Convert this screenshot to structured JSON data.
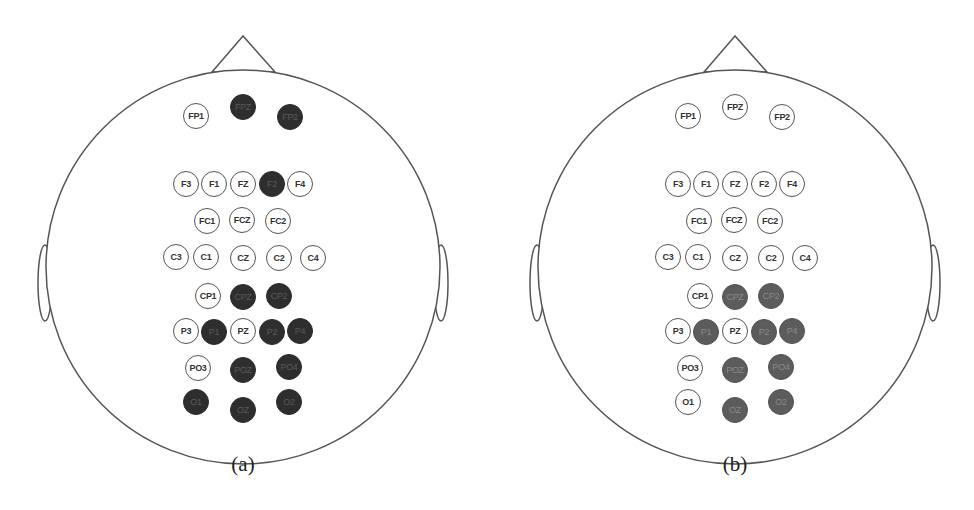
{
  "figure": {
    "panels": [
      {
        "id": "a",
        "caption": "(a)",
        "fill_color": "#2e2e2e",
        "electrodes": [
          {
            "label": "FP1",
            "x": 196,
            "y": 116,
            "selected": false
          },
          {
            "label": "FPZ",
            "x": 243,
            "y": 107,
            "selected": true
          },
          {
            "label": "FP2",
            "x": 290,
            "y": 117,
            "selected": true
          },
          {
            "label": "F3",
            "x": 186,
            "y": 184,
            "selected": false
          },
          {
            "label": "F1",
            "x": 214,
            "y": 184,
            "selected": false
          },
          {
            "label": "FZ",
            "x": 243,
            "y": 184,
            "selected": false
          },
          {
            "label": "F2",
            "x": 272,
            "y": 184,
            "selected": true
          },
          {
            "label": "F4",
            "x": 300,
            "y": 184,
            "selected": false
          },
          {
            "label": "FC1",
            "x": 207,
            "y": 221,
            "selected": false
          },
          {
            "label": "FCZ",
            "x": 242,
            "y": 220,
            "selected": false
          },
          {
            "label": "FC2",
            "x": 278,
            "y": 221,
            "selected": false
          },
          {
            "label": "C3",
            "x": 176,
            "y": 257,
            "selected": false
          },
          {
            "label": "C1",
            "x": 206,
            "y": 257,
            "selected": false
          },
          {
            "label": "CZ",
            "x": 243,
            "y": 258,
            "selected": false
          },
          {
            "label": "C2",
            "x": 279,
            "y": 258,
            "selected": false
          },
          {
            "label": "C4",
            "x": 313,
            "y": 258,
            "selected": false
          },
          {
            "label": "CP1",
            "x": 208,
            "y": 296,
            "selected": false
          },
          {
            "label": "CPZ",
            "x": 243,
            "y": 297,
            "selected": true
          },
          {
            "label": "CP2",
            "x": 279,
            "y": 296,
            "selected": true
          },
          {
            "label": "P3",
            "x": 186,
            "y": 331,
            "selected": false
          },
          {
            "label": "P1",
            "x": 214,
            "y": 332,
            "selected": true
          },
          {
            "label": "PZ",
            "x": 243,
            "y": 331,
            "selected": false
          },
          {
            "label": "P2",
            "x": 272,
            "y": 332,
            "selected": true
          },
          {
            "label": "P4",
            "x": 300,
            "y": 331,
            "selected": true
          },
          {
            "label": "PO3",
            "x": 198,
            "y": 368,
            "selected": false
          },
          {
            "label": "POZ",
            "x": 243,
            "y": 370,
            "selected": true
          },
          {
            "label": "PO4",
            "x": 289,
            "y": 367,
            "selected": true
          },
          {
            "label": "O1",
            "x": 196,
            "y": 402,
            "selected": true
          },
          {
            "label": "OZ",
            "x": 243,
            "y": 410,
            "selected": true
          },
          {
            "label": "O2",
            "x": 289,
            "y": 402,
            "selected": true
          }
        ]
      },
      {
        "id": "b",
        "caption": "(b)",
        "fill_color": "#5c5c5c",
        "electrodes": [
          {
            "label": "FP1",
            "x": 196,
            "y": 116,
            "selected": false
          },
          {
            "label": "FPZ",
            "x": 243,
            "y": 107,
            "selected": false
          },
          {
            "label": "FP2",
            "x": 290,
            "y": 117,
            "selected": false
          },
          {
            "label": "F3",
            "x": 186,
            "y": 184,
            "selected": false
          },
          {
            "label": "F1",
            "x": 214,
            "y": 184,
            "selected": false
          },
          {
            "label": "FZ",
            "x": 243,
            "y": 184,
            "selected": false
          },
          {
            "label": "F2",
            "x": 272,
            "y": 184,
            "selected": false
          },
          {
            "label": "F4",
            "x": 300,
            "y": 184,
            "selected": false
          },
          {
            "label": "FC1",
            "x": 207,
            "y": 221,
            "selected": false
          },
          {
            "label": "FCZ",
            "x": 242,
            "y": 220,
            "selected": false
          },
          {
            "label": "FC2",
            "x": 278,
            "y": 221,
            "selected": false
          },
          {
            "label": "C3",
            "x": 176,
            "y": 257,
            "selected": false
          },
          {
            "label": "C1",
            "x": 206,
            "y": 257,
            "selected": false
          },
          {
            "label": "CZ",
            "x": 243,
            "y": 258,
            "selected": false
          },
          {
            "label": "C2",
            "x": 279,
            "y": 258,
            "selected": false
          },
          {
            "label": "C4",
            "x": 313,
            "y": 258,
            "selected": false
          },
          {
            "label": "CP1",
            "x": 208,
            "y": 296,
            "selected": false
          },
          {
            "label": "CPZ",
            "x": 243,
            "y": 297,
            "selected": true
          },
          {
            "label": "CP2",
            "x": 279,
            "y": 296,
            "selected": true
          },
          {
            "label": "P3",
            "x": 186,
            "y": 331,
            "selected": false
          },
          {
            "label": "P1",
            "x": 214,
            "y": 332,
            "selected": true
          },
          {
            "label": "PZ",
            "x": 243,
            "y": 331,
            "selected": false
          },
          {
            "label": "P2",
            "x": 272,
            "y": 332,
            "selected": true
          },
          {
            "label": "P4",
            "x": 300,
            "y": 331,
            "selected": true
          },
          {
            "label": "PO3",
            "x": 198,
            "y": 368,
            "selected": false
          },
          {
            "label": "POZ",
            "x": 243,
            "y": 370,
            "selected": true
          },
          {
            "label": "PO4",
            "x": 289,
            "y": 367,
            "selected": true
          },
          {
            "label": "O1",
            "x": 196,
            "y": 402,
            "selected": false
          },
          {
            "label": "OZ",
            "x": 243,
            "y": 410,
            "selected": true
          },
          {
            "label": "O2",
            "x": 289,
            "y": 402,
            "selected": true
          }
        ]
      }
    ]
  }
}
